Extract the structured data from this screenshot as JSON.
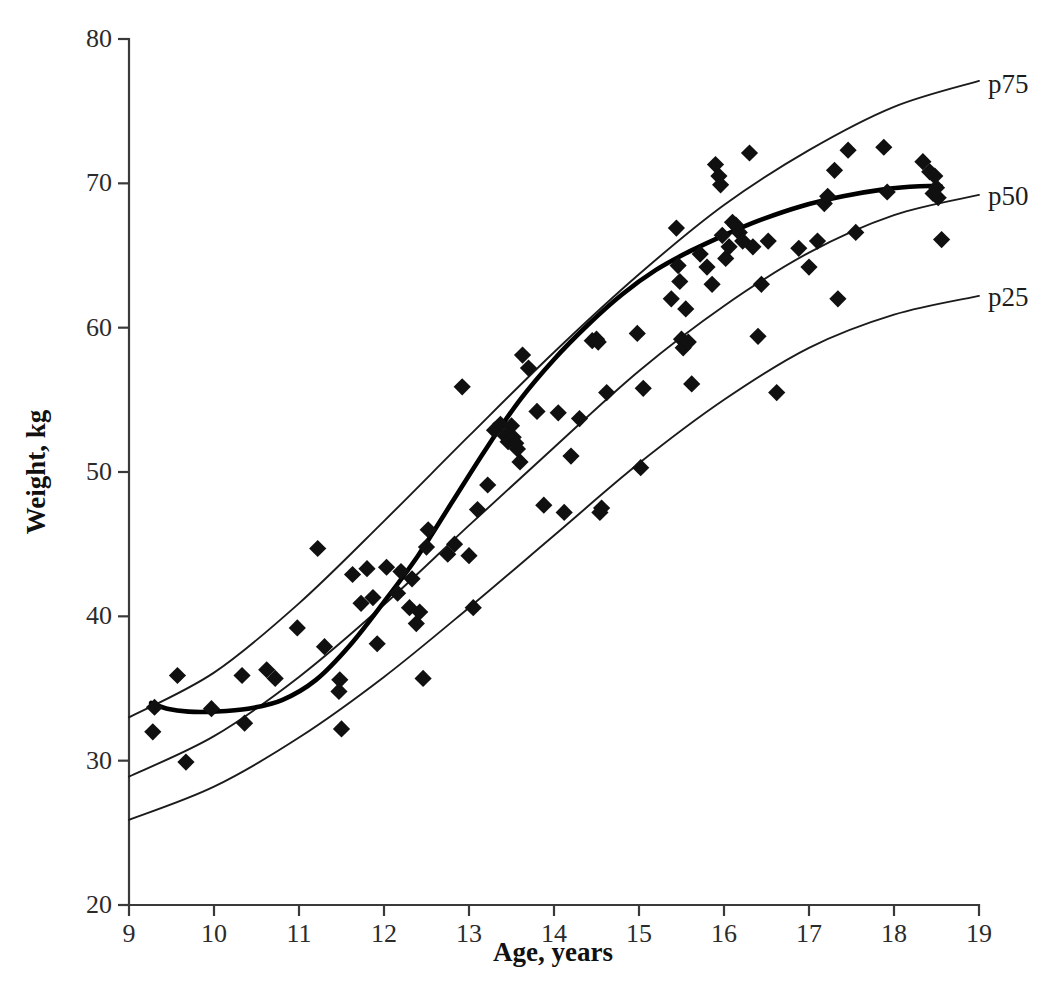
{
  "chart_data": {
    "type": "scatter",
    "title": "",
    "subtitle": "",
    "xlabel": "Age, years",
    "ylabel": "Weight, kg",
    "xlim": [
      9,
      19
    ],
    "ylim": [
      20,
      80
    ],
    "xticks": [
      9,
      10,
      11,
      12,
      13,
      14,
      15,
      16,
      17,
      18,
      19
    ],
    "yticks": [
      20,
      30,
      40,
      50,
      60,
      70,
      80
    ],
    "grid": false,
    "legend_position": "right-inline",
    "annotations": [
      "p75",
      "p50",
      "p25"
    ],
    "series": [
      {
        "name": "observations",
        "type": "scatter",
        "marker": "diamond",
        "color": "#101010",
        "points": [
          [
            9.3,
            33.7
          ],
          [
            9.28,
            32.0
          ],
          [
            9.57,
            35.9
          ],
          [
            9.67,
            29.9
          ],
          [
            9.97,
            33.6
          ],
          [
            10.36,
            32.6
          ],
          [
            10.33,
            35.9
          ],
          [
            10.62,
            36.3
          ],
          [
            10.72,
            35.7
          ],
          [
            10.98,
            39.2
          ],
          [
            11.22,
            44.7
          ],
          [
            11.3,
            37.9
          ],
          [
            11.47,
            34.8
          ],
          [
            11.48,
            35.6
          ],
          [
            11.5,
            32.2
          ],
          [
            11.63,
            42.9
          ],
          [
            11.73,
            40.9
          ],
          [
            11.8,
            43.3
          ],
          [
            11.87,
            41.3
          ],
          [
            11.92,
            38.1
          ],
          [
            12.03,
            43.4
          ],
          [
            12.16,
            41.6
          ],
          [
            12.2,
            43.1
          ],
          [
            12.3,
            40.6
          ],
          [
            12.33,
            42.6
          ],
          [
            12.38,
            39.5
          ],
          [
            12.42,
            40.3
          ],
          [
            12.46,
            35.7
          ],
          [
            12.5,
            44.8
          ],
          [
            12.52,
            46.0
          ],
          [
            12.75,
            44.3
          ],
          [
            12.83,
            45.0
          ],
          [
            12.92,
            55.9
          ],
          [
            13.0,
            44.2
          ],
          [
            13.05,
            40.6
          ],
          [
            13.1,
            47.4
          ],
          [
            13.22,
            49.1
          ],
          [
            13.3,
            52.9
          ],
          [
            13.37,
            53.3
          ],
          [
            13.43,
            52.5
          ],
          [
            13.46,
            52.1
          ],
          [
            13.5,
            53.2
          ],
          [
            13.52,
            52.4
          ],
          [
            13.55,
            52.0
          ],
          [
            13.57,
            51.6
          ],
          [
            13.6,
            50.7
          ],
          [
            13.63,
            58.1
          ],
          [
            13.7,
            57.2
          ],
          [
            13.8,
            54.2
          ],
          [
            13.88,
            47.7
          ],
          [
            14.05,
            54.1
          ],
          [
            14.12,
            47.2
          ],
          [
            14.2,
            51.1
          ],
          [
            14.3,
            53.7
          ],
          [
            14.45,
            59.1
          ],
          [
            14.5,
            59.2
          ],
          [
            14.52,
            59.0
          ],
          [
            14.54,
            47.2
          ],
          [
            14.56,
            47.5
          ],
          [
            14.62,
            55.5
          ],
          [
            14.98,
            59.6
          ],
          [
            15.02,
            50.3
          ],
          [
            15.05,
            55.8
          ],
          [
            15.38,
            62.0
          ],
          [
            15.44,
            66.9
          ],
          [
            15.46,
            64.3
          ],
          [
            15.48,
            63.2
          ],
          [
            15.5,
            59.2
          ],
          [
            15.52,
            58.6
          ],
          [
            15.55,
            61.3
          ],
          [
            15.58,
            59.0
          ],
          [
            15.62,
            56.1
          ],
          [
            15.72,
            65.1
          ],
          [
            15.8,
            64.2
          ],
          [
            15.86,
            63.0
          ],
          [
            15.9,
            71.3
          ],
          [
            15.94,
            70.5
          ],
          [
            15.96,
            69.9
          ],
          [
            15.98,
            66.4
          ],
          [
            16.02,
            64.8
          ],
          [
            16.06,
            65.6
          ],
          [
            16.1,
            67.3
          ],
          [
            16.14,
            67.1
          ],
          [
            16.18,
            66.6
          ],
          [
            16.22,
            66.0
          ],
          [
            16.3,
            72.1
          ],
          [
            16.34,
            65.6
          ],
          [
            16.4,
            59.4
          ],
          [
            16.44,
            63.0
          ],
          [
            16.52,
            66.0
          ],
          [
            16.62,
            55.5
          ],
          [
            16.88,
            65.5
          ],
          [
            17.0,
            64.2
          ],
          [
            17.1,
            66.0
          ],
          [
            17.18,
            68.6
          ],
          [
            17.22,
            69.1
          ],
          [
            17.3,
            70.9
          ],
          [
            17.34,
            62.0
          ],
          [
            17.46,
            72.3
          ],
          [
            17.55,
            66.6
          ],
          [
            17.88,
            72.5
          ],
          [
            17.92,
            69.4
          ],
          [
            18.34,
            71.5
          ],
          [
            18.42,
            70.8
          ],
          [
            18.46,
            69.3
          ],
          [
            18.48,
            70.5
          ],
          [
            18.5,
            69.7
          ],
          [
            18.52,
            69.0
          ],
          [
            18.56,
            66.1
          ]
        ]
      },
      {
        "name": "p75",
        "type": "line",
        "label": "p75",
        "color": "#1b1b1b",
        "points": [
          [
            9.0,
            33.0
          ],
          [
            10.0,
            36.1
          ],
          [
            11.0,
            40.9
          ],
          [
            12.0,
            46.6
          ],
          [
            13.0,
            52.5
          ],
          [
            14.0,
            58.3
          ],
          [
            15.0,
            63.7
          ],
          [
            16.0,
            68.5
          ],
          [
            17.0,
            72.3
          ],
          [
            18.0,
            75.3
          ],
          [
            19.0,
            77.1
          ]
        ]
      },
      {
        "name": "p50",
        "type": "line",
        "label": "p50",
        "color": "#1b1b1b",
        "points": [
          [
            9.0,
            28.9
          ],
          [
            10.0,
            31.7
          ],
          [
            11.0,
            35.8
          ],
          [
            12.0,
            40.8
          ],
          [
            13.0,
            46.3
          ],
          [
            14.0,
            51.7
          ],
          [
            15.0,
            57.0
          ],
          [
            16.0,
            61.5
          ],
          [
            17.0,
            65.2
          ],
          [
            18.0,
            67.8
          ],
          [
            19.0,
            69.2
          ]
        ]
      },
      {
        "name": "p25",
        "type": "line",
        "label": "p25",
        "color": "#1b1b1b",
        "points": [
          [
            9.0,
            25.9
          ],
          [
            10.0,
            28.2
          ],
          [
            11.0,
            31.6
          ],
          [
            12.0,
            35.8
          ],
          [
            13.0,
            40.6
          ],
          [
            14.0,
            45.6
          ],
          [
            15.0,
            50.6
          ],
          [
            16.0,
            55.0
          ],
          [
            17.0,
            58.6
          ],
          [
            18.0,
            60.9
          ],
          [
            19.0,
            62.2
          ]
        ]
      },
      {
        "name": "smoothed-mean",
        "type": "line",
        "label": "",
        "color": "#000000",
        "points": [
          [
            9.26,
            34.0
          ],
          [
            9.45,
            33.6
          ],
          [
            9.7,
            33.4
          ],
          [
            10.0,
            33.4
          ],
          [
            10.4,
            33.6
          ],
          [
            10.8,
            34.2
          ],
          [
            11.2,
            35.6
          ],
          [
            11.6,
            38.0
          ],
          [
            12.0,
            41.0
          ],
          [
            12.4,
            44.2
          ],
          [
            12.8,
            47.9
          ],
          [
            13.2,
            51.6
          ],
          [
            13.6,
            55.0
          ],
          [
            14.0,
            57.8
          ],
          [
            14.4,
            60.2
          ],
          [
            14.8,
            62.3
          ],
          [
            15.2,
            64.0
          ],
          [
            15.6,
            65.3
          ],
          [
            16.0,
            66.4
          ],
          [
            16.4,
            67.4
          ],
          [
            16.9,
            68.4
          ],
          [
            17.4,
            69.1
          ],
          [
            17.9,
            69.6
          ],
          [
            18.3,
            69.8
          ],
          [
            18.55,
            69.8
          ]
        ]
      }
    ]
  },
  "axes": {
    "x_ticks": [
      "9",
      "10",
      "11",
      "12",
      "13",
      "14",
      "15",
      "16",
      "17",
      "18",
      "19"
    ],
    "y_ticks": [
      "20",
      "30",
      "40",
      "50",
      "60",
      "70",
      "80"
    ],
    "x_title": "Age, years",
    "y_title": "Weight, kg"
  },
  "annotations": {
    "p75": "p75",
    "p50": "p50",
    "p25": "p25"
  },
  "colors": {
    "marker": "#101010",
    "curve": "#1b1b1b",
    "smoothed": "#000000",
    "axis": "#3a3a3a",
    "background": "#ffffff"
  }
}
